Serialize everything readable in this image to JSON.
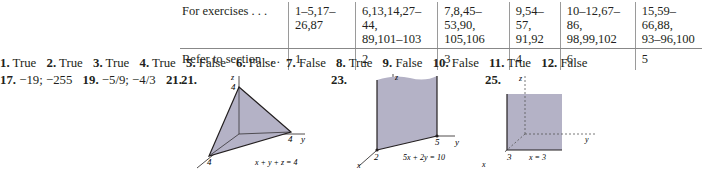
{
  "table": {
    "row_headers": [
      "For exercises . . .",
      "Refer to section . . ."
    ],
    "columns": [
      {
        "exercises": [
          "1–5,17–26,87"
        ],
        "section": "1"
      },
      {
        "exercises": [
          "6,13,14,27–44,",
          "89,101–103"
        ],
        "section": "2"
      },
      {
        "exercises": [
          "7,8,45–53,90,",
          "105,106"
        ],
        "section": "3"
      },
      {
        "exercises": [
          "9,54–57,",
          "91,92"
        ],
        "section": "4"
      },
      {
        "exercises": [
          "10–12,67–86,",
          "98,99,102"
        ],
        "section": "6"
      },
      {
        "exercises": [
          "15,59–66,88,",
          "93–96,100"
        ],
        "section": "5"
      }
    ]
  },
  "answers_row1": [
    {
      "num": "1.",
      "text": "True"
    },
    {
      "num": "2.",
      "text": "True"
    },
    {
      "num": "3.",
      "text": "True"
    },
    {
      "num": "4.",
      "text": "True"
    },
    {
      "num": "5.",
      "text": "False"
    },
    {
      "num": "6.",
      "text": "False"
    },
    {
      "num": "7.",
      "text": "False"
    },
    {
      "num": "8.",
      "text": "True"
    },
    {
      "num": "9.",
      "text": "False"
    },
    {
      "num": "10.",
      "text": "False"
    },
    {
      "num": "11.",
      "text": "True"
    },
    {
      "num": "12.",
      "text": "False"
    }
  ],
  "answers_row2": [
    {
      "num": "17.",
      "text": "−19; −255"
    },
    {
      "num": "19.",
      "text": "−5/9; −4/3"
    },
    {
      "num": "21.",
      "text": ""
    }
  ],
  "figures": {
    "fig21": {
      "label": "21.",
      "equation": "x + y + z = 4",
      "z_tick": "4",
      "y_tick": "4",
      "x_tick": "4",
      "z_axis": "z",
      "y_axis": "y"
    },
    "fig23": {
      "label": "23.",
      "equation": "5x + 2y = 10",
      "x_tick": "2",
      "y_tick": "5",
      "z_axis": "z",
      "y_axis": "y",
      "x_axis": "x"
    },
    "fig25": {
      "label": "25.",
      "equation": "x = 3",
      "x_tick": "3",
      "z_axis": "z",
      "y_axis": "y",
      "x_axis": "x"
    }
  },
  "colors": {
    "shade": "#b4b2c6",
    "text": "#231f20"
  }
}
